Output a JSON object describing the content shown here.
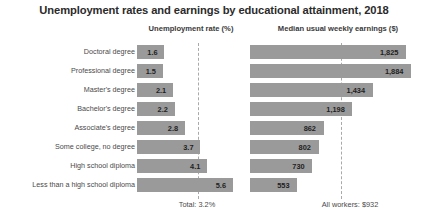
{
  "title": "Unemployment rates and earnings by educational attainment, 2018",
  "headers": {
    "left": "Unemployment rate (%)",
    "right": "Median usual weekly earnings ($)"
  },
  "footer": {
    "left": "Total: 3.2%",
    "right": "All workers: $932"
  },
  "colors": {
    "bar": "#9a9a9a",
    "refline": "#a9a9a9",
    "text": "#333333"
  },
  "chart_data": {
    "type": "bar",
    "title": "Unemployment rates and earnings by educational attainment, 2018",
    "orientation": "horizontal",
    "categories": [
      "Doctoral degree",
      "Professional degree",
      "Master's degree",
      "Bachelor's degree",
      "Associate's degree",
      "Some college, no degree",
      "High school diploma",
      "Less than a high school diploma"
    ],
    "series": [
      {
        "name": "Unemployment rate (%)",
        "xlabel": "Unemployment rate (%)",
        "values": [
          1.6,
          1.5,
          2.1,
          2.2,
          2.8,
          3.7,
          4.1,
          5.6
        ],
        "labels": [
          "1.6",
          "1.5",
          "2.1",
          "2.2",
          "2.8",
          "3.7",
          "4.1",
          "5.6"
        ],
        "xlim": [
          0,
          6.2
        ],
        "reference_line": {
          "value": 3.2,
          "label": "Total: 3.2%"
        }
      },
      {
        "name": "Median usual weekly earnings ($)",
        "xlabel": "Median usual weekly earnings ($)",
        "values": [
          1825,
          1884,
          1434,
          1198,
          862,
          802,
          730,
          553
        ],
        "labels": [
          "1,825",
          "1,884",
          "1,434",
          "1,198",
          "862",
          "802",
          "730",
          "553"
        ],
        "xlim": [
          0,
          2060
        ],
        "reference_line": {
          "value": 932,
          "label": "All workers: $932"
        }
      }
    ],
    "grid": false,
    "legend": "none"
  }
}
